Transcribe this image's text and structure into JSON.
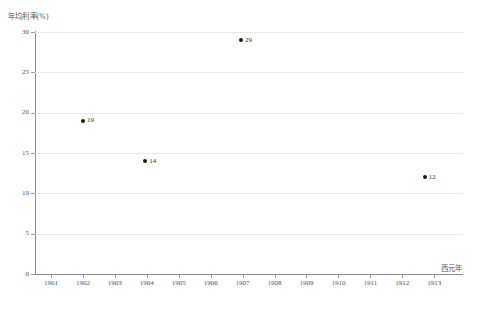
{
  "chart_data": {
    "type": "scatter",
    "title": "",
    "xlabel": "西元年",
    "ylabel": "年均利率(%)",
    "xlim": [
      1900.5,
      1913.9
    ],
    "ylim": [
      0,
      30
    ],
    "grid": true,
    "grid_axis": "y",
    "legend": false,
    "x_ticks": [
      1901,
      1902,
      1903,
      1904,
      1905,
      1906,
      1907,
      1908,
      1909,
      1910,
      1911,
      1912,
      1913
    ],
    "x_tick_labels": [
      "1901",
      "1902",
      "1903",
      "1904",
      "1905",
      "1906",
      "1907",
      "1908",
      "1909",
      "1910",
      "1911",
      "1912",
      "1913"
    ],
    "y_ticks": [
      0,
      5,
      10,
      15,
      20,
      25,
      30
    ],
    "y_tick_labels": [
      "0",
      "5",
      "10",
      "15",
      "20",
      "25",
      "30"
    ],
    "points": [
      {
        "x": 1902.0,
        "y": 19,
        "label": "19"
      },
      {
        "x": 1903.95,
        "y": 14,
        "label": "14"
      },
      {
        "x": 1906.95,
        "y": 29,
        "label": "29"
      },
      {
        "x": 1912.7,
        "y": 12,
        "label": "12"
      }
    ],
    "marker_color": "#1a1a1a",
    "grid_color": "#e8e8e8",
    "axis_color": "#8c8c8c"
  }
}
